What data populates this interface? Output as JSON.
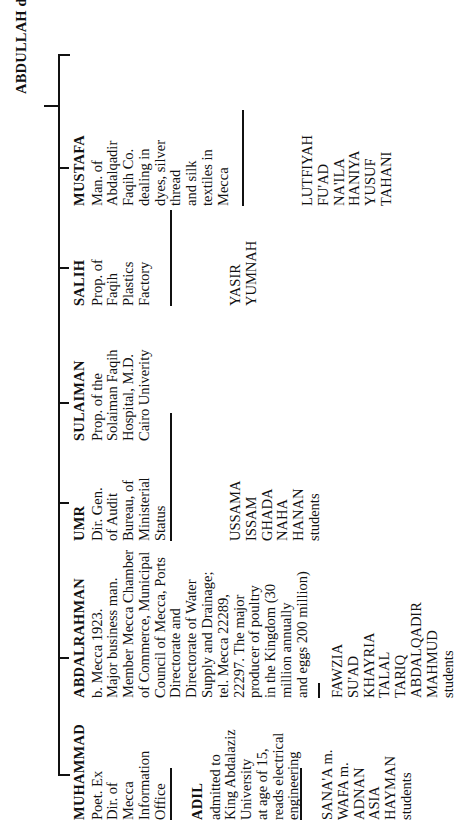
{
  "chart_title": "ABDULLAH d.",
  "root": {
    "name": "ABDULLAH d.",
    "label": "ABDULLAH",
    "suffix": "d."
  },
  "orientation": "text rotated 90 degrees counter-clockwise (reads bottom-to-top)",
  "colors": {
    "ink": "#111111",
    "paper": "#ffffff"
  },
  "generations": [
    {
      "label": "children of ABDULLAH",
      "people": [
        {
          "id": "mustafa",
          "name": "MUSTAFA",
          "description": "Man. of\nAbdalqadir\nFaqih Co.\ndealing in\ndyes, silver\nthread\nand silk\ntextiles in\nMecca",
          "children_connector": "long",
          "children": "LUTFIYAH\nFU'AD\nNA'ILA\nHANIYA\nYUSUF\nTAHANI"
        },
        {
          "id": "salih",
          "name": "SALIH",
          "description": "Prop. of\nFaqih\nPlastics\nFactory",
          "children_connector": "long",
          "children": "YASIR\nYUMNAH"
        },
        {
          "id": "sulaiman",
          "name": "SULAIMAN",
          "description": "Prop. of the\nSolaiman Faqih\nHospital, M.D.\nCairo Univerity",
          "children_connector": "none",
          "children": ""
        },
        {
          "id": "umr",
          "name": "UMR",
          "description": "Dir. Gen.\nof Audit\nBureau, of\nMinisterial\nStatus",
          "children_connector": "long",
          "children": "USSAMA\nISSAM\nGHADA\nNAHA\nHANAN\nstudents"
        },
        {
          "id": "abdalrahman",
          "name": "ABDALRAHMAN",
          "description": "b. Mecca 1923.\nMajor business man.\nMember Mecca Chamber\nof Commerce, Municipal\nCouncil of Mecca, Ports\nDirectorate and\nDirectorate of Water\nSupply and Drainage;\ntel. Mecca 22289,\n22297.  The major\nproducer of poultry\nin the Kingdom (30\nmillion annually\nand eggs 200 million)",
          "children_connector": "short",
          "children": "FAWZIA\nSU'AD\nKHAYRIA\nTALAL\nTARIQ\nABDALQADIR\nMAHMUD\nstudents"
        },
        {
          "id": "muhammad",
          "name": "MUHAMMAD",
          "description": "Poet. Ex\nDir. of\nMecca\nInformation\nOffice",
          "children_connector": "medium",
          "children": ""
        }
      ]
    },
    {
      "label": "grandchildren branch under MUHAMMAD",
      "people": [
        {
          "id": "adil",
          "name": "ADIL",
          "description": "admitted to\nKing Abdalaziz\nUniversity\nat age of 15,\nreads electrical\nengineering",
          "children_connector": "medium",
          "children": "SANA'A m.\nWAFA m.\nADNAN\nASIA\nHAYMAN\nstudents"
        }
      ]
    }
  ]
}
